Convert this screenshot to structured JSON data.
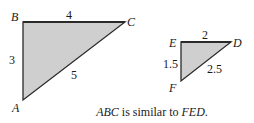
{
  "colors": {
    "fill": "#cfcfcf",
    "stroke": "#2a2a2a",
    "text": "#1a1a1a",
    "background": "#ffffff"
  },
  "triangle_abc": {
    "vertices": {
      "A": "A",
      "B": "B",
      "C": "C"
    },
    "sides": {
      "AB": "3",
      "BC": "4",
      "AC": "5"
    }
  },
  "triangle_fed": {
    "vertices": {
      "E": "E",
      "D": "D",
      "F": "F"
    },
    "sides": {
      "EF": "1.5",
      "ED": "2",
      "FD": "2.5"
    }
  },
  "caption": {
    "part1": "ABC",
    "part2": " is similar to ",
    "part3": "FED",
    "part4": "."
  }
}
